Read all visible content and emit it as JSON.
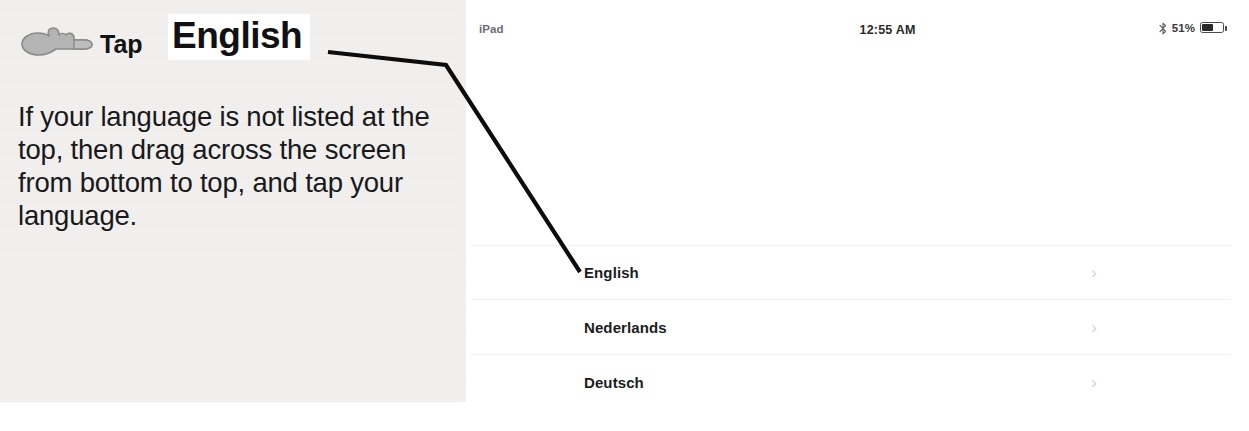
{
  "annotation": {
    "hand_icon": "pointing-hand-icon",
    "tap_word": "Tap",
    "target_word": "English",
    "instruction": "If your language is not listed at the top, then drag across the screen from bottom to top, and tap your language."
  },
  "ipad": {
    "status_bar": {
      "device_label": "iPad",
      "clock": "12:55 AM",
      "bluetooth_icon": "bluetooth-icon",
      "battery_percent": "51%",
      "battery_level": 51,
      "battery_icon": "battery-icon"
    },
    "language_list": {
      "chevron_icon": "chevron-right-icon",
      "rows": [
        {
          "label": "English"
        },
        {
          "label": "Nederlands"
        },
        {
          "label": "Deutsch"
        }
      ]
    }
  },
  "colors": {
    "paper_background": "#f1f0ef",
    "screen_background": "#ffffff",
    "ink": "#111111",
    "hand_gray": "#a9a9a9",
    "chevron_gray": "#d2d2d7",
    "separator": "#f1f1f3",
    "status_gray": "#6d6d72"
  }
}
